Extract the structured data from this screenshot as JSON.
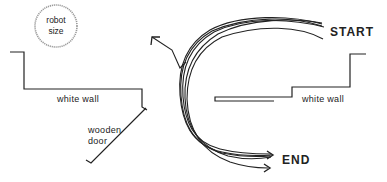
{
  "diagram": {
    "robot": {
      "line1": "robot",
      "line2": "size"
    },
    "labels": {
      "start": "START",
      "end": "END",
      "white_wall_left": "white wall",
      "white_wall_right": "white wall",
      "wooden_door_line1": "wooden",
      "wooden_door_line2": "door"
    },
    "colors": {
      "ink": "#222222",
      "robot_circle": "#9a9a9a",
      "background": "#ffffff"
    }
  }
}
